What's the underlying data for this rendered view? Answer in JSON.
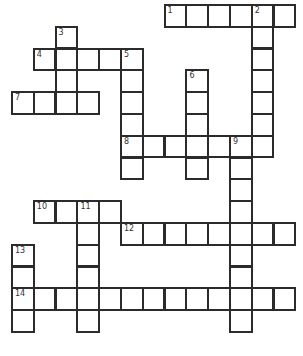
{
  "puzzle": {
    "type": "crossword",
    "cell_size": 21.8,
    "origin": {
      "x": 12,
      "y": 5
    },
    "border_color": "#2b2b2b",
    "entries": [
      {
        "number": 1,
        "direction": "across",
        "row": 0,
        "col": 7,
        "length": 6
      },
      {
        "number": 2,
        "direction": "down",
        "row": 0,
        "col": 11,
        "length": 7
      },
      {
        "number": 3,
        "direction": "down",
        "row": 1,
        "col": 2,
        "length": 3
      },
      {
        "number": 4,
        "direction": "across",
        "row": 2,
        "col": 1,
        "length": 5
      },
      {
        "number": 5,
        "direction": "down",
        "row": 2,
        "col": 5,
        "length": 6
      },
      {
        "number": 6,
        "direction": "down",
        "row": 3,
        "col": 8,
        "length": 5
      },
      {
        "number": 7,
        "direction": "across",
        "row": 4,
        "col": 0,
        "length": 4
      },
      {
        "number": 8,
        "direction": "across",
        "row": 6,
        "col": 5,
        "length": 7
      },
      {
        "number": 9,
        "direction": "down",
        "row": 6,
        "col": 10,
        "length": 9
      },
      {
        "number": 10,
        "direction": "across",
        "row": 9,
        "col": 1,
        "length": 4
      },
      {
        "number": 11,
        "direction": "down",
        "row": 9,
        "col": 3,
        "length": 6
      },
      {
        "number": 12,
        "direction": "across",
        "row": 10,
        "col": 5,
        "length": 8
      },
      {
        "number": 13,
        "direction": "down",
        "row": 11,
        "col": 0,
        "length": 4
      },
      {
        "number": 14,
        "direction": "across",
        "row": 13,
        "col": 0,
        "length": 13
      }
    ]
  }
}
